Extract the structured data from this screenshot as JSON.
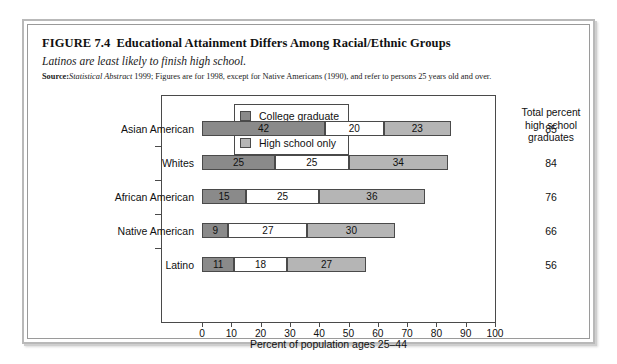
{
  "figure": {
    "number": "FIGURE 7.4",
    "title": "Educational Attainment Differs Among Racial/Ethnic Groups",
    "subtitle": "Latinos are least likely to finish high school.",
    "source_label": "Source:",
    "source_italic": "Statistical Abstract",
    "source_rest": " 1999; Figures are for 1998, except for Native Americans (1990), and refer to persons 25 years old and over."
  },
  "legend": {
    "items": [
      {
        "label": "College graduate",
        "color": "#8a8a8a"
      },
      {
        "label": "Some college",
        "color": "#ffffff"
      },
      {
        "label": "High school only",
        "color": "#b5b5b5"
      }
    ]
  },
  "totals_header": {
    "line1": "Total percent",
    "line2": "high school",
    "line3": "graduates"
  },
  "chart_data": {
    "type": "bar",
    "orientation": "horizontal",
    "stacked": true,
    "title": "Educational Attainment Differs Among Racial/Ethnic Groups",
    "subtitle": "Latinos are least likely to finish high school.",
    "xlabel": "Percent of population ages 25–44",
    "ylabel": "",
    "xlim": [
      0,
      100
    ],
    "xticks": [
      0,
      10,
      20,
      30,
      40,
      50,
      60,
      70,
      80,
      90,
      100
    ],
    "xtick_labels": [
      "0",
      "10",
      "20",
      "30",
      "40",
      "50",
      "60",
      "70",
      "80",
      "90",
      "100"
    ],
    "grid": false,
    "legend_position": "top-center-inside",
    "categories": [
      "Asian American",
      "Whites",
      "African American",
      "Native American",
      "Latino"
    ],
    "series": [
      {
        "name": "College graduate",
        "color": "#8a8a8a",
        "values": [
          42,
          25,
          15,
          9,
          11
        ]
      },
      {
        "name": "Some college",
        "color": "#ffffff",
        "values": [
          20,
          25,
          25,
          27,
          18
        ]
      },
      {
        "name": "High school only",
        "color": "#b5b5b5",
        "values": [
          23,
          34,
          36,
          30,
          27
        ]
      }
    ],
    "annotations": {
      "right_column_title": "Total percent high school graduates",
      "right_column_values": [
        85,
        84,
        76,
        66,
        56
      ]
    }
  },
  "axis": {
    "title": "Percent of population ages 25–44"
  }
}
